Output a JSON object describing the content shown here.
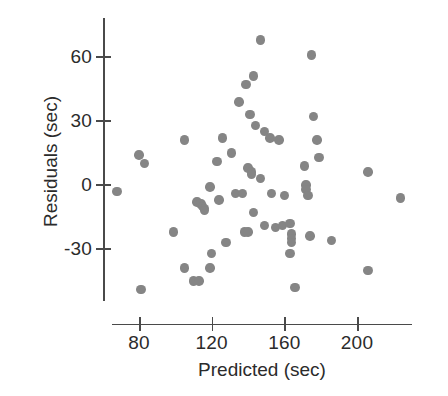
{
  "chart_data": {
    "type": "scatter",
    "title": "",
    "xlabel": "Predicted (sec)",
    "ylabel": "Residuals (sec)",
    "xlim": [
      65,
      230
    ],
    "ylim": [
      -52,
      78
    ],
    "xticks": [
      80,
      120,
      160,
      200
    ],
    "xtick_labels": [
      "80",
      "120",
      "160",
      "200"
    ],
    "yticks": [
      60,
      30,
      0,
      -30
    ],
    "ytick_labels": [
      "60",
      "30",
      "0",
      "-30"
    ],
    "grid": false,
    "legend": null,
    "marker": {
      "shape": "circle",
      "color": "#858585",
      "size_px": 9.5
    },
    "n_points": 63,
    "points": [
      {
        "x": 68,
        "y": -3
      },
      {
        "x": 80,
        "y": 14
      },
      {
        "x": 83,
        "y": 10
      },
      {
        "x": 81,
        "y": -49
      },
      {
        "x": 99,
        "y": -22
      },
      {
        "x": 105,
        "y": 21
      },
      {
        "x": 105,
        "y": -39
      },
      {
        "x": 110,
        "y": -45
      },
      {
        "x": 112,
        "y": -8
      },
      {
        "x": 114,
        "y": -9
      },
      {
        "x": 115,
        "y": -10
      },
      {
        "x": 116,
        "y": -11
      },
      {
        "x": 116,
        "y": -12
      },
      {
        "x": 113,
        "y": -45
      },
      {
        "x": 119,
        "y": -1
      },
      {
        "x": 119,
        "y": -39
      },
      {
        "x": 120,
        "y": -32
      },
      {
        "x": 123,
        "y": 11
      },
      {
        "x": 124,
        "y": -7
      },
      {
        "x": 126,
        "y": 22
      },
      {
        "x": 128,
        "y": -27
      },
      {
        "x": 131,
        "y": 15
      },
      {
        "x": 133,
        "y": -4
      },
      {
        "x": 135,
        "y": 39
      },
      {
        "x": 137,
        "y": -4
      },
      {
        "x": 138,
        "y": -22
      },
      {
        "x": 139,
        "y": 47
      },
      {
        "x": 140,
        "y": 8
      },
      {
        "x": 140,
        "y": -22
      },
      {
        "x": 141,
        "y": 33
      },
      {
        "x": 142,
        "y": 6
      },
      {
        "x": 142,
        "y": 5
      },
      {
        "x": 143,
        "y": 51
      },
      {
        "x": 143,
        "y": -13
      },
      {
        "x": 144,
        "y": 28
      },
      {
        "x": 147,
        "y": 68
      },
      {
        "x": 147,
        "y": 3
      },
      {
        "x": 149,
        "y": 25
      },
      {
        "x": 149,
        "y": -19
      },
      {
        "x": 152,
        "y": 22
      },
      {
        "x": 153,
        "y": -4
      },
      {
        "x": 155,
        "y": -20
      },
      {
        "x": 157,
        "y": 21
      },
      {
        "x": 159,
        "y": -19
      },
      {
        "x": 160,
        "y": -5
      },
      {
        "x": 163,
        "y": -18
      },
      {
        "x": 164,
        "y": -23
      },
      {
        "x": 164,
        "y": -25
      },
      {
        "x": 164,
        "y": -27
      },
      {
        "x": 163,
        "y": -32
      },
      {
        "x": 166,
        "y": -48
      },
      {
        "x": 171,
        "y": 9
      },
      {
        "x": 172,
        "y": 0
      },
      {
        "x": 172,
        "y": -2
      },
      {
        "x": 173,
        "y": -5
      },
      {
        "x": 174,
        "y": -24
      },
      {
        "x": 175,
        "y": 61
      },
      {
        "x": 176,
        "y": 32
      },
      {
        "x": 178,
        "y": 21
      },
      {
        "x": 179,
        "y": 13
      },
      {
        "x": 186,
        "y": -26
      },
      {
        "x": 206,
        "y": 6
      },
      {
        "x": 206,
        "y": -40
      },
      {
        "x": 224,
        "y": -6
      }
    ]
  }
}
